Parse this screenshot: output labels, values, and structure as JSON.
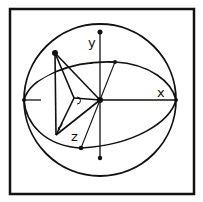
{
  "figure": {
    "axes": {
      "x_label": "x",
      "y_label": "y",
      "z_label": "z"
    },
    "tick_labels": {
      "y_minus": "-"
    },
    "colors": {
      "stroke": "#111111",
      "background": "#ffffff"
    },
    "annotations": {
      "angle_marker_theta": "angle-arc",
      "angle_marker_phi": "angle-arc"
    }
  }
}
